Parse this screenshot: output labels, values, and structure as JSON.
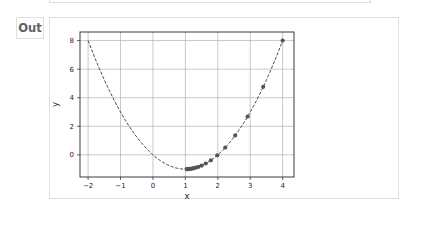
{
  "cell": {
    "prompt_label": "Out"
  },
  "chart_data": {
    "type": "line",
    "title": "",
    "xlabel": "x",
    "ylabel": "y",
    "xlim": [
      -2.25,
      4.35
    ],
    "ylim": [
      -1.55,
      8.6
    ],
    "grid": true,
    "xticks": [
      -2,
      -1,
      0,
      1,
      2,
      3,
      4
    ],
    "yticks": [
      0,
      2,
      4,
      6,
      8
    ],
    "series": [
      {
        "name": "f(x) = x^2 - 2x",
        "style": "dashed",
        "color": "#4a4a4a",
        "x": [
          -2,
          -1.5,
          -1,
          -0.5,
          0,
          0.5,
          1,
          1.5,
          2,
          2.5,
          3,
          3.5,
          4
        ],
        "y": [
          8,
          5.25,
          3,
          1.25,
          0,
          -0.75,
          -1,
          -0.75,
          0,
          1.25,
          3,
          5.25,
          8
        ]
      },
      {
        "name": "gradient descent iterates",
        "style": "markers",
        "color": "#555555",
        "x": [
          4.0,
          3.4,
          2.92,
          2.536,
          2.229,
          1.983,
          1.786,
          1.629,
          1.503,
          1.403,
          1.322,
          1.258,
          1.206,
          1.165,
          1.132,
          1.106,
          1.084,
          1.068,
          1.054,
          1.043
        ],
        "y": [
          8.0,
          4.76,
          2.686,
          1.359,
          0.51,
          -0.034,
          -0.382,
          -0.605,
          -0.747,
          -0.838,
          -0.896,
          -0.933,
          -0.957,
          -0.973,
          -0.983,
          -0.989,
          -0.993,
          -0.995,
          -0.997,
          -0.998
        ]
      }
    ]
  }
}
